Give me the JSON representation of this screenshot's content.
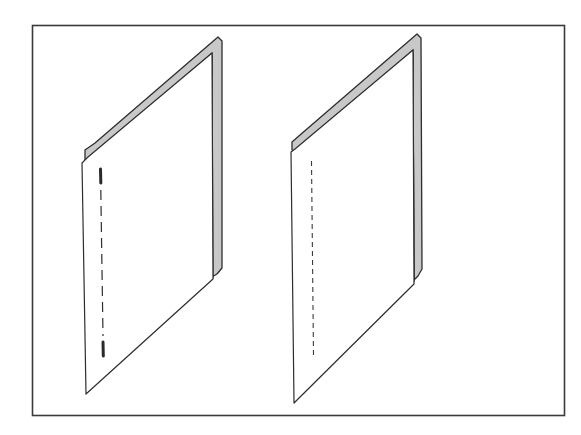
{
  "figure": {
    "description": "Two folded sheets shown in oblique perspective inside a rectangular frame; left sheet has a dashed stitch line with heavy end marks, right sheet has a finer dashed line",
    "colors": {
      "background": "#ffffff",
      "stroke": "#333333",
      "fold_fill": "#c8c8c8",
      "sheet_fill": "#ffffff"
    },
    "frame": {
      "label": "frame"
    },
    "panels": [
      {
        "id": "left",
        "label": "Folded sheet with stitched spine (heavy end stitches)",
        "line_style": "dashed with bold ends"
      },
      {
        "id": "right",
        "label": "Folded sheet with perforated fold line",
        "line_style": "fine dashed"
      }
    ]
  }
}
